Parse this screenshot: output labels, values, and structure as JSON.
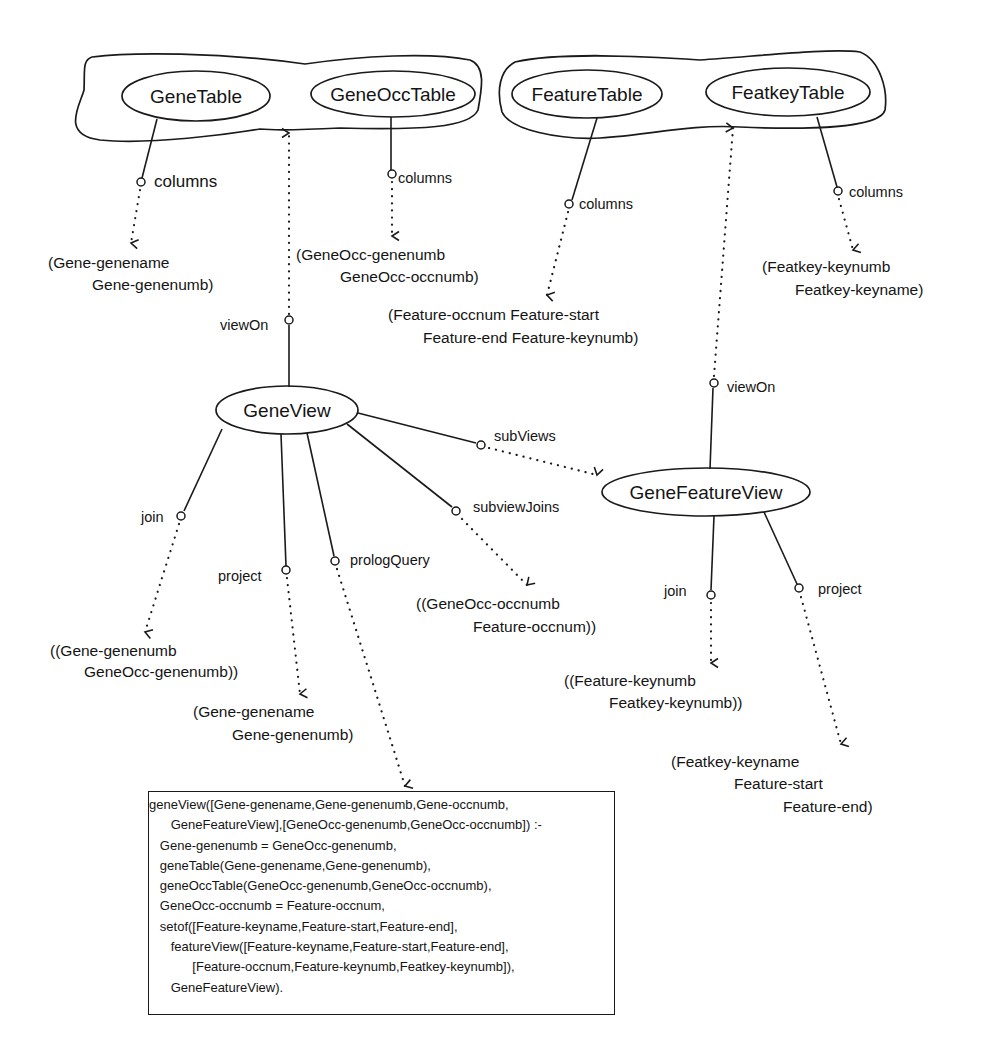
{
  "diagram": {
    "clusters": [
      {
        "id": "gene-tables-cluster",
        "members": [
          "GeneTable",
          "GeneOccTable"
        ]
      },
      {
        "id": "feature-tables-cluster",
        "members": [
          "FeatureTable",
          "FeatkeyTable"
        ]
      }
    ],
    "nodes": {
      "gene_table": "GeneTable",
      "gene_occ_table": "GeneOccTable",
      "feature_table": "FeatureTable",
      "featkey_table": "FeatkeyTable",
      "gene_view": "GeneView",
      "gene_feature_view": "GeneFeatureView"
    },
    "edge_labels": {
      "gene_table_columns": "columns",
      "gene_occ_table_columns": "columns",
      "feature_table_columns": "columns",
      "featkey_table_columns": "columns",
      "gene_view_view_on": "viewOn",
      "gene_feature_view_view_on": "viewOn",
      "gene_view_sub_views": "subViews",
      "gene_view_subview_joins": "subviewJoins",
      "gene_view_join": "join",
      "gene_view_project": "project",
      "gene_view_prolog_query": "prologQuery",
      "gene_feature_view_join": "join",
      "gene_feature_view_project": "project"
    },
    "values": {
      "gene_table_columns": [
        "(Gene-genename",
        "Gene-genenumb)"
      ],
      "gene_occ_table_columns": [
        "(GeneOcc-genenumb",
        "GeneOcc-occnumb)"
      ],
      "feature_table_columns": [
        "(Feature-occnum Feature-start",
        "Feature-end Feature-keynumb)"
      ],
      "featkey_table_columns": [
        "(Featkey-keynumb",
        "Featkey-keyname)"
      ],
      "gene_view_join": [
        "((Gene-genenumb",
        "GeneOcc-genenumb))"
      ],
      "gene_view_project": [
        "(Gene-genename",
        "Gene-genenumb)"
      ],
      "gene_view_subview_joins": [
        "((GeneOcc-occnumb",
        "Feature-occnum))"
      ],
      "gene_feature_view_join": [
        "((Feature-keynumb",
        "Featkey-keynumb))"
      ],
      "gene_feature_view_project": [
        "(Featkey-keyname",
        "Feature-start",
        "Feature-end)"
      ]
    },
    "prolog_query": [
      "geneView([Gene-genename,Gene-genenumb,Gene-occnumb,",
      "      GeneFeatureView],[GeneOcc-genenumb,GeneOcc-occnumb]) :-",
      "   Gene-genenumb = GeneOcc-genenumb,",
      "   geneTable(Gene-genename,Gene-genenumb),",
      "   geneOccTable(GeneOcc-genenumb,GeneOcc-occnumb),",
      "   GeneOcc-occnumb = Feature-occnum,",
      "   setof([Feature-keyname,Feature-start,Feature-end],",
      "      featureView([Feature-keyname,Feature-start,Feature-end],",
      "            [Feature-occnum,Feature-keynumb,Featkey-keynumb]),",
      "      GeneFeatureView)."
    ]
  }
}
